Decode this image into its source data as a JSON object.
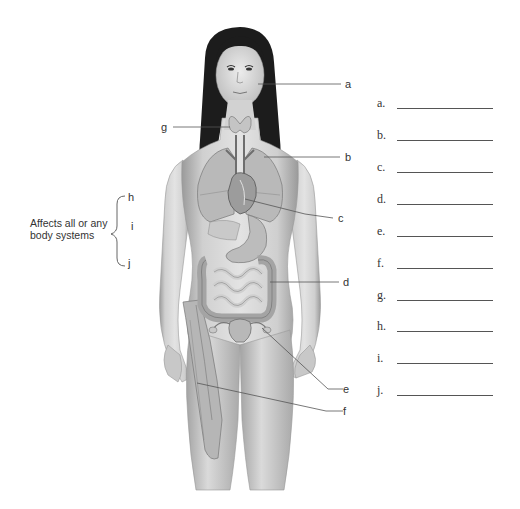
{
  "diagram": {
    "type": "anatomical-labeling-figure",
    "callouts": [
      {
        "id": "a",
        "label": "a",
        "points_to": "face / skin"
      },
      {
        "id": "b",
        "label": "b",
        "points_to": "lungs"
      },
      {
        "id": "c",
        "label": "c",
        "points_to": "heart"
      },
      {
        "id": "d",
        "label": "d",
        "points_to": "intestines"
      },
      {
        "id": "e",
        "label": "e",
        "points_to": "uterus / ovaries"
      },
      {
        "id": "f",
        "label": "f",
        "points_to": "thigh muscles"
      },
      {
        "id": "g",
        "label": "g",
        "points_to": "thyroid gland"
      }
    ],
    "bracket_group": {
      "labels": [
        "h",
        "i",
        "j"
      ],
      "note": "Affects all or any body systems",
      "note_lines": [
        "Affects all or any",
        "body systems"
      ]
    }
  },
  "answer_blanks": [
    {
      "letter": "a.",
      "value": ""
    },
    {
      "letter": "b.",
      "value": ""
    },
    {
      "letter": "c.",
      "value": ""
    },
    {
      "letter": "d.",
      "value": ""
    },
    {
      "letter": "e.",
      "value": ""
    },
    {
      "letter": "f.",
      "value": ""
    },
    {
      "letter": "g.",
      "value": ""
    },
    {
      "letter": "h.",
      "value": ""
    },
    {
      "letter": "i.",
      "value": ""
    },
    {
      "letter": "j.",
      "value": ""
    }
  ],
  "colors": {
    "skin": "#d8d8d8",
    "skin_shadow": "#a8a8a8",
    "hair": "#1c1c1c",
    "organ": "#bdbdbd",
    "organ_dark": "#8e8e8e",
    "leader_line": "#555555",
    "text": "#333333"
  }
}
